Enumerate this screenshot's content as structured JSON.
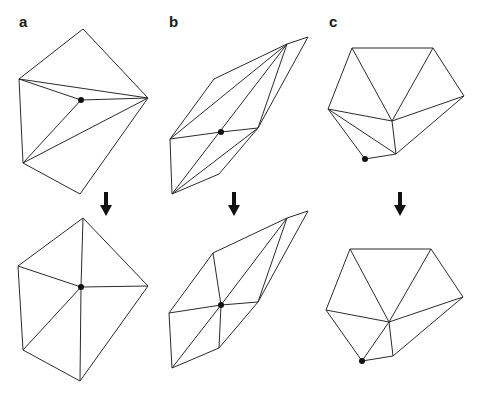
{
  "panels": [
    {
      "label": "a",
      "label_pos": [
        19,
        27
      ],
      "arrow": {
        "x": 106,
        "y1": 192,
        "y2": 216
      },
      "before": {
        "vertices": {
          "T": [
            83,
            29
          ],
          "L": [
            19,
            79
          ],
          "R": [
            148,
            98
          ],
          "C": [
            81,
            100
          ],
          "LL": [
            23,
            163
          ],
          "B": [
            80,
            194
          ]
        },
        "edges": [
          [
            "T",
            "L"
          ],
          [
            "T",
            "R"
          ],
          [
            "L",
            "R"
          ],
          [
            "L",
            "C"
          ],
          [
            "C",
            "R"
          ],
          [
            "L",
            "LL"
          ],
          [
            "C",
            "LL"
          ],
          [
            "LL",
            "R"
          ],
          [
            "LL",
            "B"
          ],
          [
            "B",
            "R"
          ]
        ],
        "marked": "C"
      },
      "after": {
        "vertices": {
          "T": [
            83,
            218
          ],
          "L": [
            18,
            266
          ],
          "R": [
            148,
            286
          ],
          "C": [
            81,
            287
          ],
          "LL": [
            23,
            350
          ],
          "B": [
            80,
            381
          ]
        },
        "edges": [
          [
            "T",
            "L"
          ],
          [
            "T",
            "R"
          ],
          [
            "T",
            "C"
          ],
          [
            "L",
            "C"
          ],
          [
            "C",
            "R"
          ],
          [
            "L",
            "LL"
          ],
          [
            "C",
            "LL"
          ],
          [
            "C",
            "B"
          ],
          [
            "LL",
            "B"
          ],
          [
            "B",
            "R"
          ]
        ],
        "marked": "C"
      }
    },
    {
      "label": "b",
      "label_pos": [
        169,
        27
      ],
      "arrow": {
        "x": 234,
        "y1": 192,
        "y2": 216
      },
      "before": {
        "vertices": {
          "FTR": [
            308,
            37
          ],
          "T": [
            287,
            44
          ],
          "UL": [
            214,
            79
          ],
          "L": [
            170,
            139
          ],
          "C": [
            221,
            132
          ],
          "MR": [
            258,
            128
          ],
          "LR": [
            219,
            174
          ],
          "B": [
            172,
            194
          ]
        },
        "edges": [
          [
            "T",
            "FTR"
          ],
          [
            "FTR",
            "MR"
          ],
          [
            "T",
            "UL"
          ],
          [
            "UL",
            "L"
          ],
          [
            "T",
            "L"
          ],
          [
            "T",
            "MR"
          ],
          [
            "L",
            "C"
          ],
          [
            "C",
            "MR"
          ],
          [
            "L",
            "B"
          ],
          [
            "B",
            "T"
          ],
          [
            "B",
            "MR"
          ],
          [
            "B",
            "LR"
          ],
          [
            "LR",
            "MR"
          ]
        ],
        "marked": "C"
      },
      "after": {
        "vertices": {
          "FTR": [
            308,
            211
          ],
          "T": [
            287,
            218
          ],
          "UL": [
            213,
            253
          ],
          "L": [
            169,
            313
          ],
          "C": [
            221,
            305
          ],
          "MR": [
            258,
            302
          ],
          "LR": [
            219,
            348
          ],
          "B": [
            172,
            368
          ]
        },
        "edges": [
          [
            "T",
            "FTR"
          ],
          [
            "FTR",
            "MR"
          ],
          [
            "T",
            "UL"
          ],
          [
            "UL",
            "L"
          ],
          [
            "UL",
            "C"
          ],
          [
            "T",
            "MR"
          ],
          [
            "T",
            "C"
          ],
          [
            "L",
            "C"
          ],
          [
            "C",
            "MR"
          ],
          [
            "L",
            "B"
          ],
          [
            "B",
            "C"
          ],
          [
            "C",
            "LR"
          ],
          [
            "LR",
            "MR"
          ],
          [
            "B",
            "LR"
          ]
        ],
        "marked": "C"
      }
    },
    {
      "label": "c",
      "label_pos": [
        329,
        27
      ],
      "arrow": {
        "x": 400,
        "y1": 192,
        "y2": 216
      },
      "before": {
        "vertices": {
          "TL": [
            352,
            48
          ],
          "TR": [
            433,
            48
          ],
          "R": [
            464,
            96
          ],
          "L": [
            328,
            109
          ],
          "C": [
            392,
            121
          ],
          "LO": [
            396,
            154
          ],
          "D": [
            365,
            159
          ]
        },
        "edges": [
          [
            "TL",
            "TR"
          ],
          [
            "TR",
            "R"
          ],
          [
            "TL",
            "L"
          ],
          [
            "TL",
            "C"
          ],
          [
            "TR",
            "C"
          ],
          [
            "R",
            "C"
          ],
          [
            "R",
            "LO"
          ],
          [
            "L",
            "C"
          ],
          [
            "C",
            "LO"
          ],
          [
            "L",
            "LO"
          ],
          [
            "L",
            "D"
          ],
          [
            "D",
            "LO"
          ]
        ],
        "marked": "D"
      },
      "after": {
        "vertices": {
          "TL": [
            350,
            249
          ],
          "TR": [
            431,
            249
          ],
          "R": [
            463,
            297
          ],
          "L": [
            326,
            310
          ],
          "C": [
            389,
            322
          ],
          "LO": [
            393,
            356
          ],
          "D": [
            362,
            361
          ]
        },
        "edges": [
          [
            "TL",
            "TR"
          ],
          [
            "TR",
            "R"
          ],
          [
            "TL",
            "L"
          ],
          [
            "TL",
            "C"
          ],
          [
            "TR",
            "C"
          ],
          [
            "R",
            "C"
          ],
          [
            "R",
            "LO"
          ],
          [
            "L",
            "C"
          ],
          [
            "C",
            "LO"
          ],
          [
            "C",
            "D"
          ],
          [
            "L",
            "D"
          ],
          [
            "D",
            "LO"
          ]
        ],
        "marked": "D"
      }
    }
  ]
}
